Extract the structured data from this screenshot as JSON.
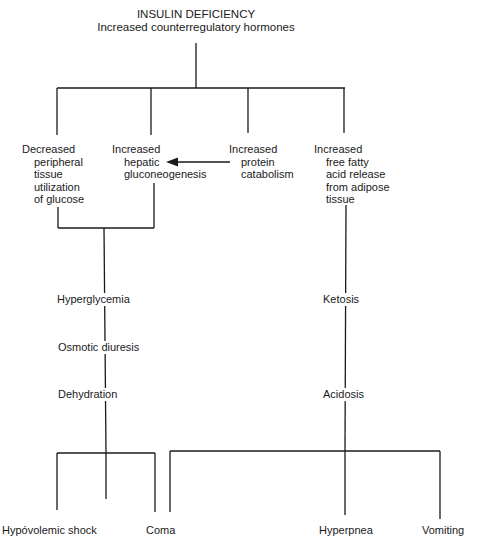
{
  "root": {
    "title": "INSULIN DEFICIENCY",
    "subtitle": "Increased counterregulatory hormones"
  },
  "causes": [
    {
      "lines": [
        "Decreased",
        "peripheral",
        "tissue",
        "utilization",
        "of glucose"
      ]
    },
    {
      "lines": [
        "Increased",
        "hepatic",
        "gluconeogenesis"
      ]
    },
    {
      "lines": [
        "Increased",
        "protein",
        "catabolism"
      ]
    },
    {
      "lines": [
        "Increased",
        "free fatty",
        "acid release",
        "from adipose",
        "tissue"
      ]
    }
  ],
  "left_chain": [
    "Hyperglycemia",
    "Osmotic diuresis",
    "Dehydration"
  ],
  "right_chain": [
    "Ketosis",
    "Acidosis"
  ],
  "outcomes": [
    "Hypóvolemic shock",
    "Coma",
    "Hyperpnea",
    "Vomiting"
  ],
  "arrows": [
    {
      "from": "Increased protein catabolism",
      "to": "Increased hepatic gluconeogenesis"
    }
  ]
}
